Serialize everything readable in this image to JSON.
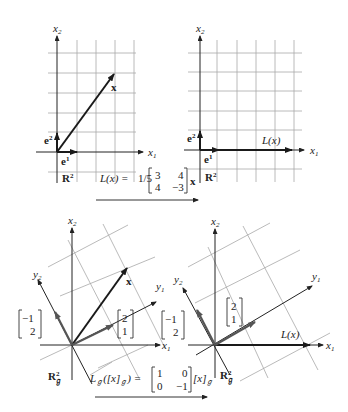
{
  "figure": {
    "top_row": {
      "left_panel": {
        "space_label": "R",
        "space_sup": "2",
        "axis_x1": "x",
        "axis_x1_sub": "1",
        "axis_x2": "x",
        "axis_x2_sub": "2",
        "vector_x_label": "x",
        "basis_e1": "e",
        "basis_e1_sup": "1",
        "basis_e2": "e",
        "basis_e2_sup": "2"
      },
      "right_panel": {
        "space_label": "R",
        "space_sup": "2",
        "axis_x1": "x",
        "axis_x1_sub": "1",
        "axis_x2": "x",
        "axis_x2_sub": "2",
        "image_label": "L(x)",
        "basis_e1": "e",
        "basis_e1_sup": "1",
        "basis_e2": "e",
        "basis_e2_sup": "2"
      },
      "transformation": {
        "lhs": "L(x) =",
        "scalar": "1/5",
        "matrix": [
          [
            "3",
            "4"
          ],
          [
            "4",
            "−3"
          ]
        ],
        "rhs": "x"
      }
    },
    "bottom_row": {
      "left_panel": {
        "space_label": "R",
        "space_sup": "2",
        "space_sub": "ℊ",
        "axis_x1": "x",
        "axis_x1_sub": "1",
        "axis_x2": "x",
        "axis_x2_sub": "2",
        "axis_y1": "y",
        "axis_y1_sub": "1",
        "axis_y2": "y",
        "axis_y2_sub": "2",
        "vector_x_label": "x",
        "basis_vec1": [
          "2",
          "1"
        ],
        "basis_vec2": [
          "−1",
          "2"
        ]
      },
      "right_panel": {
        "space_label": "R",
        "space_sup": "2",
        "space_sub": "ℊ",
        "axis_x1": "x",
        "axis_x1_sub": "1",
        "axis_x2": "x",
        "axis_x2_sub": "2",
        "axis_y1": "y",
        "axis_y1_sub": "1",
        "axis_y2": "y",
        "axis_y2_sub": "2",
        "image_label": "L(x)",
        "basis_vec1": [
          "2",
          "1"
        ],
        "basis_vec2": [
          "−1",
          "2"
        ]
      },
      "transformation": {
        "lhs": "L",
        "lhs_sub": "ℊ",
        "lhs_arg": "([x]",
        "lhs_arg_sub": "ℊ",
        "lhs_close": ") =",
        "matrix": [
          [
            "1",
            "0"
          ],
          [
            "0",
            "−1"
          ]
        ],
        "rhs": "[x]",
        "rhs_sub": "ℊ"
      }
    }
  }
}
